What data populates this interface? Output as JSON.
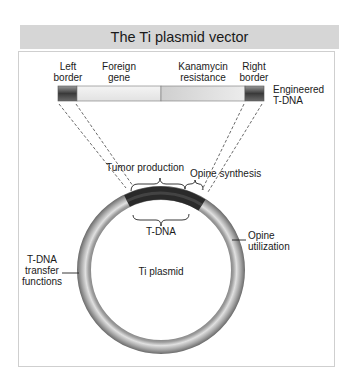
{
  "title": "The Ti plasmid vector",
  "engineered_tdna": {
    "label_line1": "Engineered",
    "label_line2": "T-DNA",
    "segments": [
      {
        "name": "Left border",
        "line1": "Left",
        "line2": "border"
      },
      {
        "name": "Foreign gene",
        "line1": "Foreign",
        "line2": "gene"
      },
      {
        "name": "Kanamycin resistance",
        "line1": "Kanamycin",
        "line2": "resistance"
      },
      {
        "name": "Right border",
        "line1": "Right",
        "line2": "border"
      }
    ]
  },
  "plasmid": {
    "center_label": "Ti plasmid",
    "regions": {
      "tumor_production": "Tumor production",
      "opine_synthesis": "Opine synthesis",
      "tdna": "T-DNA",
      "opine_utilization_line1": "Opine",
      "opine_utilization_line2": "utilization",
      "transfer_line1": "T-DNA",
      "transfer_line2": "transfer",
      "transfer_line3": "functions"
    }
  },
  "colors": {
    "title_bg": "#d6d6d6",
    "panel_border": "#cfcfcf",
    "ring": "#8c8c8c",
    "tdna_dark": "#2a2a2a"
  }
}
